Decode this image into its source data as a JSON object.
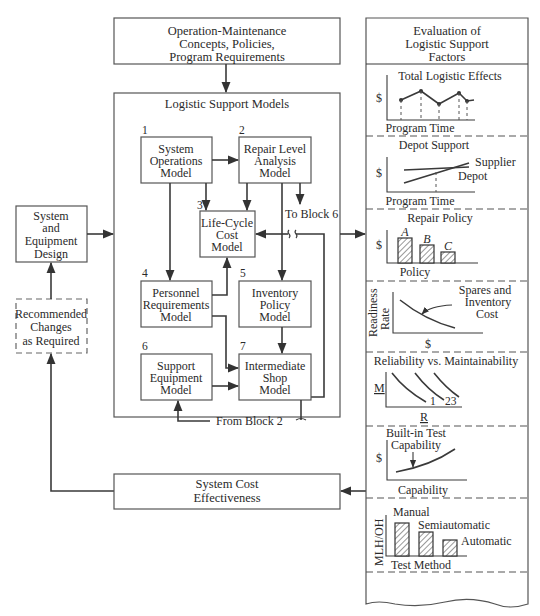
{
  "diagram": {
    "top_box": {
      "lines": [
        "Operation-Maintenance",
        "Concepts, Policies,",
        "Program Requirements"
      ]
    },
    "models_panel": {
      "title": "Logistic Support Models",
      "blocks": [
        {
          "number": "1",
          "lines": [
            "System",
            "Operations",
            "Model"
          ]
        },
        {
          "number": "2",
          "lines": [
            "Repair Level",
            "Analysis",
            "Model"
          ]
        },
        {
          "number": "3",
          "lines": [
            "Life-Cycle",
            "Cost",
            "Model"
          ]
        },
        {
          "number": "4",
          "lines": [
            "Personnel",
            "Requirements",
            "Model"
          ]
        },
        {
          "number": "5",
          "lines": [
            "Inventory",
            "Policy",
            "Model"
          ]
        },
        {
          "number": "6",
          "lines": [
            "Support",
            "Equipment",
            "Model"
          ]
        },
        {
          "number": "7",
          "lines": [
            "Intermediate",
            "Shop",
            "Model"
          ]
        }
      ],
      "to_block_label": "To Block 6",
      "from_block_label": "From Block 2"
    },
    "design_box": {
      "lines": [
        "System",
        "and",
        "Equipment",
        "Design"
      ]
    },
    "changes_box": {
      "lines": [
        "Recommended",
        "Changes",
        "as Required"
      ]
    },
    "cost_box": {
      "lines": [
        "System Cost",
        "Effectiveness"
      ]
    },
    "evaluation_panel": {
      "title_lines": [
        "Evaluation of",
        "Logistic Support",
        "Factors"
      ],
      "sections": [
        {
          "title": "Total Logistic Effects",
          "ylabel": "$",
          "xlabel": "Program Time"
        },
        {
          "title": "Depot Support",
          "ylabel": "$",
          "xlabel": "Program Time",
          "series": [
            "Supplier",
            "Depot"
          ]
        },
        {
          "title": "Repair Policy",
          "ylabel": "$",
          "xlabel": "Policy",
          "bars": [
            "A",
            "B",
            "C"
          ]
        },
        {
          "title": "Spares and Inventory Cost",
          "title_lines": [
            "Spares and",
            "Inventory",
            "Cost"
          ],
          "ylabel_lines": [
            "Readiness",
            "Rate"
          ],
          "xlabel": "$"
        },
        {
          "title": "Reliability vs. Maintainability",
          "ylabel": "M",
          "xlabel": "R",
          "curve_labels": [
            "1",
            "23"
          ]
        },
        {
          "title": "Built-in Test Capability",
          "title_lines": [
            "Built-in Test",
            "Capability"
          ],
          "ylabel": "$",
          "xlabel": "Capability"
        },
        {
          "title": "Test Method",
          "ylabel": "MLH/OH",
          "xlabel": "Test Method",
          "bars": [
            "Manual",
            "Semiautomatic",
            "Automatic"
          ]
        }
      ]
    }
  }
}
